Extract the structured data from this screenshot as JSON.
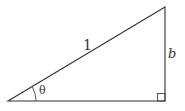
{
  "diagram": {
    "type": "right-triangle",
    "labels": {
      "hypotenuse": "1",
      "opposite": "b",
      "angle": "θ"
    },
    "colors": {
      "stroke": "#333333",
      "background": "#ffffff"
    }
  }
}
